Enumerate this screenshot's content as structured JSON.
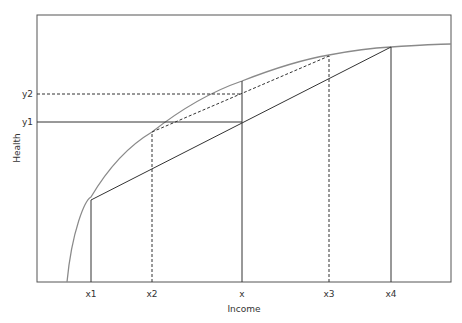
{
  "diagram": {
    "x_axis_title": "Income",
    "y_axis_title": "Health",
    "x_ticks": [
      {
        "label": "x1",
        "x": 91
      },
      {
        "label": "x2",
        "x": 152
      },
      {
        "label": "x",
        "x": 242
      },
      {
        "label": "x3",
        "x": 329
      },
      {
        "label": "x4",
        "x": 391
      }
    ],
    "y_ticks": [
      {
        "label": "y2",
        "y": 94
      },
      {
        "label": "y1",
        "y": 122
      }
    ],
    "colors": {
      "curve": "#8a8a8a",
      "lines": "#333333",
      "frame": "#555555"
    }
  }
}
